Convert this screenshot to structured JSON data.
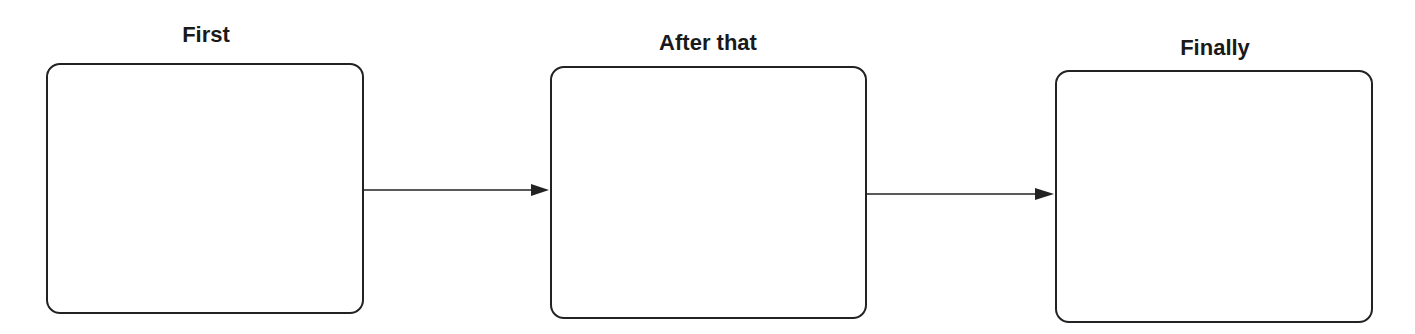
{
  "diagram": {
    "type": "sequence-flow",
    "colors": {
      "stroke": "#222222",
      "text": "#1a1a1a",
      "background": "#ffffff"
    },
    "steps": [
      {
        "label": "First",
        "content": ""
      },
      {
        "label": "After that",
        "content": ""
      },
      {
        "label": "Finally",
        "content": ""
      }
    ],
    "connectors": [
      {
        "from": "First",
        "to": "After that",
        "icon": "arrow-right-icon"
      },
      {
        "from": "After that",
        "to": "Finally",
        "icon": "arrow-right-icon"
      }
    ]
  }
}
